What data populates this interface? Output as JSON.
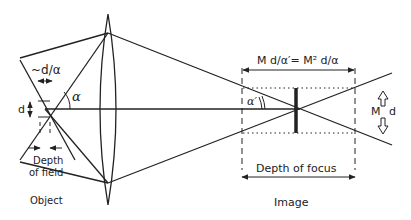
{
  "diagram": {
    "type": "optics-depth-of-field-and-focus",
    "colors": {
      "line": "#222222",
      "background": "#ffffff"
    },
    "labels": {
      "object_width": "~d/α",
      "object_height": "d",
      "object_angle": "α",
      "depth_of_field_line1": "Depth",
      "depth_of_field_line2": "of field",
      "object": "Object",
      "image_width_formula": "M d/α′= M² d/α",
      "image_angle": "α′",
      "image_height_M": "M",
      "image_height_d": "d",
      "depth_of_focus": "Depth of focus",
      "image": "Image"
    },
    "elements": [
      "object-focus-point",
      "converging-lens",
      "optical-axis",
      "marginal-rays",
      "image-plane-bar",
      "depth-of-focus-bounds"
    ]
  }
}
